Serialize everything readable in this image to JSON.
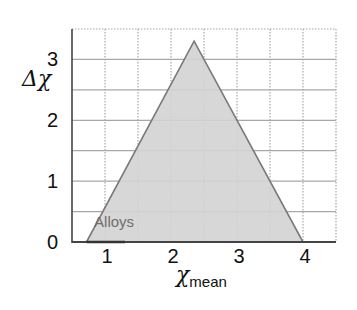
{
  "chart_data": {
    "type": "area",
    "title": "",
    "xlabel": "χ_mean",
    "xlabel_main": "χ",
    "xlabel_sub": "mean",
    "ylabel": "Δχ",
    "xlim": [
      0.5,
      4.5
    ],
    "ylim": [
      0,
      3.5
    ],
    "xticks": [
      1,
      2,
      3,
      4
    ],
    "yticks": [
      0,
      1,
      2,
      3
    ],
    "grid": true,
    "grid_step": 0.5,
    "legend": null,
    "series": [
      {
        "name": "Alloys",
        "shape": "triangle",
        "points": [
          [
            0.72,
            0
          ],
          [
            2.35,
            3.3
          ],
          [
            4.0,
            0
          ]
        ],
        "fill": "#d3d3d3",
        "stroke": "#7a7a7a"
      }
    ],
    "annotations": [
      {
        "text": "Alloys",
        "x": 0.85,
        "y": 0.25
      }
    ]
  },
  "colors": {
    "fill": "#d3d3d3",
    "edge": "#7a7a7a",
    "grid": "#a8a8a8",
    "axis": "#444444"
  }
}
